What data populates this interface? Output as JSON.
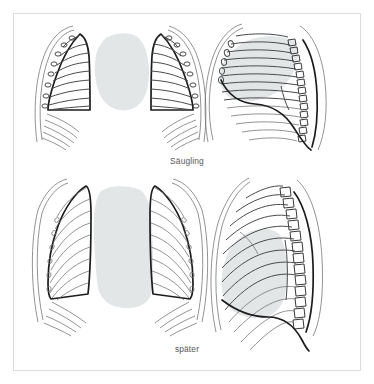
{
  "figure": {
    "type": "anatomical-illustration",
    "language": "de",
    "frame": {
      "border_color": "#dcdcdc",
      "background_color": "#ffffff"
    },
    "captions": [
      {
        "id": "saeugling",
        "text": "Säugling"
      },
      {
        "id": "spaeter",
        "text": "später"
      }
    ],
    "panels": [
      {
        "id": "infant-frontal",
        "row": "saeugling",
        "view": "frontal",
        "description": "Infant chest, frontal view: barrel-shaped thorax with horizontal ribs and wide rounded mediastinal/thymic shadow"
      },
      {
        "id": "infant-lateral",
        "row": "saeugling",
        "view": "lateral",
        "description": "Infant chest, lateral view: horizontal ribs, round vertebral bodies, rounded anterior cardiothymic shadow"
      },
      {
        "id": "adult-frontal",
        "row": "spaeter",
        "view": "frontal",
        "description": "Older child chest, frontal view: elongated thorax with downward sloping ribs and narrow tall mediastinum"
      },
      {
        "id": "adult-lateral",
        "row": "spaeter",
        "view": "lateral",
        "description": "Older child chest, lateral view: obliquely sloping ribs, squared vertebral bodies, elongated cardiac shadow"
      }
    ],
    "colors": {
      "shadow_fill": "#e3e6e7",
      "outline_bold": "#1c1c1c",
      "outline_thin": "#6d6f70",
      "caption_text": "#58585a"
    }
  }
}
